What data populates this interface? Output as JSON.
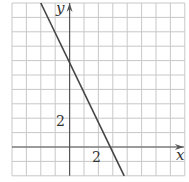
{
  "chart_data": {
    "type": "line",
    "title": "",
    "xlabel": "x",
    "ylabel": "y",
    "xlim": [
      -4,
      8
    ],
    "ylim": [
      -2,
      10
    ],
    "grid": true,
    "grid_step": 1,
    "tick_labels": {
      "x": [
        "2"
      ],
      "y": [
        "2"
      ]
    },
    "series": [
      {
        "name": "line",
        "equation": "y = -2x + 6",
        "x": [
          -2,
          0,
          3,
          4
        ],
        "y": [
          10,
          6,
          0,
          -2
        ]
      }
    ],
    "colors": {
      "grid": "#c8c8c8",
      "axis": "#555555",
      "line": "#444444"
    }
  },
  "labels": {
    "x_axis": "x",
    "y_axis": "y",
    "x_tick": "2",
    "y_tick": "2"
  }
}
